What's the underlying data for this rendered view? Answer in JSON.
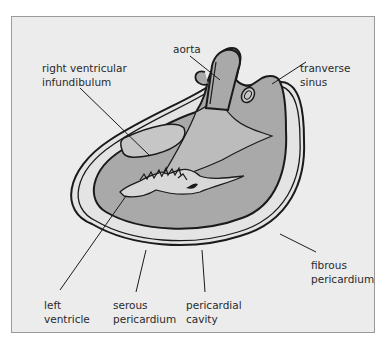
{
  "diagram": {
    "colors": {
      "background": "#ececec",
      "frame_border": "#9a9a9a",
      "heart_fill": "#a9a9a9",
      "cavity_fill": "#e4e4e4",
      "light_region": "#c6c6c6",
      "line": "#1a1a1a"
    },
    "labels": {
      "aorta": [
        "aorta"
      ],
      "right_ventricular_infundibulum": [
        "right ventricular",
        "infundibulum"
      ],
      "transverse_sinus": [
        "tranverse",
        "sinus"
      ],
      "fibrous_pericardium": [
        "fibrous",
        "pericardium"
      ],
      "left_ventricle": [
        "left",
        "ventricle"
      ],
      "serous_pericardium": [
        "serous",
        "pericardium"
      ],
      "pericardial_cavity": [
        "pericardial",
        "cavity"
      ]
    }
  }
}
